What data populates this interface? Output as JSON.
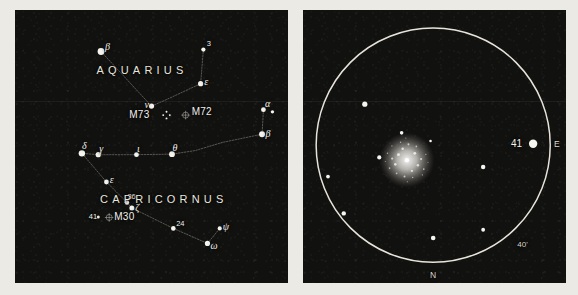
{
  "figure": {
    "kind": "star-chart-plate",
    "panels": [
      "finder-chart",
      "telescopic-field"
    ],
    "background_color": "#111110",
    "star_color": "#f7f5ef",
    "line_color": "#cfcabf",
    "paper_color": "#eceae5"
  },
  "left_panel": {
    "name": "finder-chart",
    "constellation_labels": [
      {
        "text": "AQUARIUS",
        "x": 46.5,
        "y": 22.5
      },
      {
        "text": "CAPRICORNUS",
        "x": 54.5,
        "y": 69.5
      }
    ],
    "stars": [
      {
        "label": "β",
        "id": "beta-aquarii",
        "x": 31.5,
        "y": 15.2,
        "r": 3.4,
        "lx": 4.0,
        "ly": -4.5
      },
      {
        "label": "3",
        "id": "star-3-aquarii",
        "x": 69.0,
        "y": 14.5,
        "r": 2.1,
        "lx": 3.5,
        "ly": -5.5
      },
      {
        "label": "ε",
        "id": "epsilon-aquarii",
        "x": 68.0,
        "y": 27.0,
        "r": 2.6,
        "lx": 3.6,
        "ly": -1.5
      },
      {
        "label": "ν",
        "id": "nu-aquarii",
        "x": 50.0,
        "y": 35.2,
        "r": 2.6,
        "lx": -7.0,
        "ly": -1.0
      },
      {
        "label": "α",
        "id": "alpha-capricorni",
        "x": 91.0,
        "y": 36.5,
        "r": 2.4,
        "lx": 1.5,
        "ly": -5.5
      },
      {
        "label": "",
        "id": "alpha2-capricorni",
        "x": 94.3,
        "y": 37.3,
        "r": 1.7,
        "lx": 0,
        "ly": 0
      },
      {
        "label": "β",
        "id": "beta-capricorni",
        "x": 90.5,
        "y": 45.5,
        "r": 3.0,
        "lx": 3.5,
        "ly": -0.5
      },
      {
        "label": "δ",
        "id": "delta-capricorni",
        "x": 24.5,
        "y": 52.5,
        "r": 3.2,
        "lx": 0.0,
        "ly": -7.5
      },
      {
        "label": "γ",
        "id": "gamma-capricorni",
        "x": 30.5,
        "y": 53.0,
        "r": 2.6,
        "lx": 1.0,
        "ly": -6.0
      },
      {
        "label": "ι",
        "id": "iota-capricorni",
        "x": 44.5,
        "y": 53.0,
        "r": 2.4,
        "lx": 0.5,
        "ly": -6.0
      },
      {
        "label": "θ",
        "id": "theta-capricorni",
        "x": 57.5,
        "y": 52.8,
        "r": 2.9,
        "lx": 0.5,
        "ly": -6.5
      },
      {
        "label": "ε",
        "id": "epsilon-capricorni",
        "x": 33.5,
        "y": 63.0,
        "r": 2.4,
        "lx": 3.2,
        "ly": -1.8
      },
      {
        "label": "36",
        "id": "star-36-capricorni",
        "x": 41.0,
        "y": 70.5,
        "r": 2.2,
        "lx": 0.5,
        "ly": -5.5
      },
      {
        "label": "ζ",
        "id": "zeta-capricorni",
        "x": 42.8,
        "y": 72.5,
        "r": 2.5,
        "lx": 3.4,
        "ly": 0.5
      },
      {
        "label": "24",
        "id": "star-24-capricorni",
        "x": 58.0,
        "y": 80.0,
        "r": 2.3,
        "lx": 2.8,
        "ly": -4.5
      },
      {
        "label": "ψ",
        "id": "psi-capricorni",
        "x": 75.0,
        "y": 80.0,
        "r": 2.1,
        "lx": 3.0,
        "ly": -1.0
      },
      {
        "label": "ω",
        "id": "omega-capricorni",
        "x": 70.5,
        "y": 85.5,
        "r": 2.6,
        "lx": 3.0,
        "ly": 2.5
      },
      {
        "label": "41",
        "id": "star-41-capricorni",
        "x": 30.5,
        "y": 75.8,
        "r": 1.5,
        "lx": -9.5,
        "ly": 0.0
      }
    ],
    "asterism_paths": [
      {
        "id": "aquarius-beta-nu",
        "points": [
          [
            31.5,
            15.2
          ],
          [
            50.0,
            35.2
          ]
        ]
      },
      {
        "id": "aquarius-3-epsilon",
        "points": [
          [
            69.0,
            14.5
          ],
          [
            68.0,
            27.0
          ]
        ]
      },
      {
        "id": "aquarius-epsilon-nu",
        "points": [
          [
            68.0,
            27.0
          ],
          [
            55.5,
            32.8
          ],
          [
            50.0,
            35.2
          ]
        ]
      },
      {
        "id": "capricornus-alpha-beta",
        "points": [
          [
            91.0,
            36.5
          ],
          [
            90.5,
            45.5
          ]
        ]
      },
      {
        "id": "capricornus-beta-theta",
        "points": [
          [
            90.5,
            45.5
          ],
          [
            76.0,
            48.5
          ],
          [
            66.0,
            51.5
          ],
          [
            57.5,
            52.8
          ]
        ]
      },
      {
        "id": "capricornus-theta-delta",
        "points": [
          [
            57.5,
            52.8
          ],
          [
            44.5,
            53.0
          ],
          [
            30.5,
            53.0
          ],
          [
            24.5,
            52.5
          ]
        ]
      },
      {
        "id": "capricornus-delta-zeta",
        "points": [
          [
            24.5,
            52.5
          ],
          [
            33.5,
            63.0
          ],
          [
            41.0,
            70.5
          ],
          [
            42.8,
            72.5
          ]
        ]
      },
      {
        "id": "capricornus-zeta-omega",
        "points": [
          [
            42.8,
            72.5
          ],
          [
            58.0,
            80.0
          ],
          [
            70.5,
            85.5
          ]
        ]
      },
      {
        "id": "capricornus-omega-psi",
        "points": [
          [
            70.5,
            85.5
          ],
          [
            75.0,
            80.0
          ]
        ]
      }
    ],
    "deep_sky_objects": [
      {
        "id": "m73",
        "label": "M73",
        "marker": "asterism-cross",
        "x": 55.5,
        "y": 38.5,
        "lx": -17.0,
        "ly": -0.5
      },
      {
        "id": "m72",
        "label": "M72",
        "marker": "globular-cluster",
        "x": 62.5,
        "y": 38.5,
        "lx": 6.0,
        "ly": -3.5
      },
      {
        "id": "m30",
        "label": "M30",
        "marker": "globular-cluster",
        "x": 34.5,
        "y": 76.0,
        "lx": 5.0,
        "ly": -0.5
      }
    ]
  },
  "right_panel": {
    "name": "telescopic-field",
    "field_circle": {
      "cx": 49.5,
      "cy": 49.5,
      "r": 44.5
    },
    "compass_labels": [
      {
        "text": "E",
        "x": 96.5,
        "y": 49.5,
        "name": "east-marker"
      },
      {
        "text": "N",
        "x": 49.5,
        "y": 97.5,
        "name": "north-marker"
      }
    ],
    "scale_label": {
      "text": "40'",
      "x": 81.5,
      "y": 86.5,
      "name": "field-scale-label"
    },
    "bright_star": {
      "label": "41",
      "x": 87.5,
      "y": 49.0,
      "r": 4.2,
      "lx": -11.0,
      "ly": 0.0
    },
    "cluster": {
      "id": "m30-cluster",
      "x": 39.5,
      "y": 55.0,
      "r": 10.5
    },
    "field_stars": [
      {
        "x": 23.5,
        "y": 34.5,
        "r": 2.6
      },
      {
        "x": 37.5,
        "y": 45.0,
        "r": 1.8
      },
      {
        "x": 48.5,
        "y": 48.0,
        "r": 1.3
      },
      {
        "x": 29.0,
        "y": 54.0,
        "r": 2.1
      },
      {
        "x": 9.5,
        "y": 61.0,
        "r": 1.9
      },
      {
        "x": 15.5,
        "y": 74.5,
        "r": 2.2
      },
      {
        "x": 68.5,
        "y": 57.5,
        "r": 2.2
      },
      {
        "x": 68.5,
        "y": 80.5,
        "r": 1.9
      },
      {
        "x": 49.5,
        "y": 83.5,
        "r": 2.3
      }
    ]
  }
}
